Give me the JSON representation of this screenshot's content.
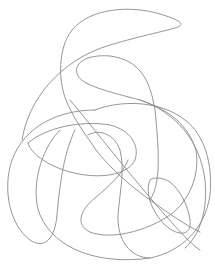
{
  "image": {
    "description": "Abstract continuous single-line drawing with looping curves on white background",
    "stroke_color": "#8a8a8a",
    "background_color": "#ffffff",
    "strokes": [
      {
        "name": "top-swoosh"
      },
      {
        "name": "upper-s-curve"
      },
      {
        "name": "left-vertical-loop"
      },
      {
        "name": "large-outer-circle"
      },
      {
        "name": "inner-arc-left"
      },
      {
        "name": "inner-arc-middle"
      },
      {
        "name": "diagonal-line"
      },
      {
        "name": "lower-loop"
      },
      {
        "name": "small-right-loop"
      },
      {
        "name": "right-arc"
      }
    ]
  }
}
